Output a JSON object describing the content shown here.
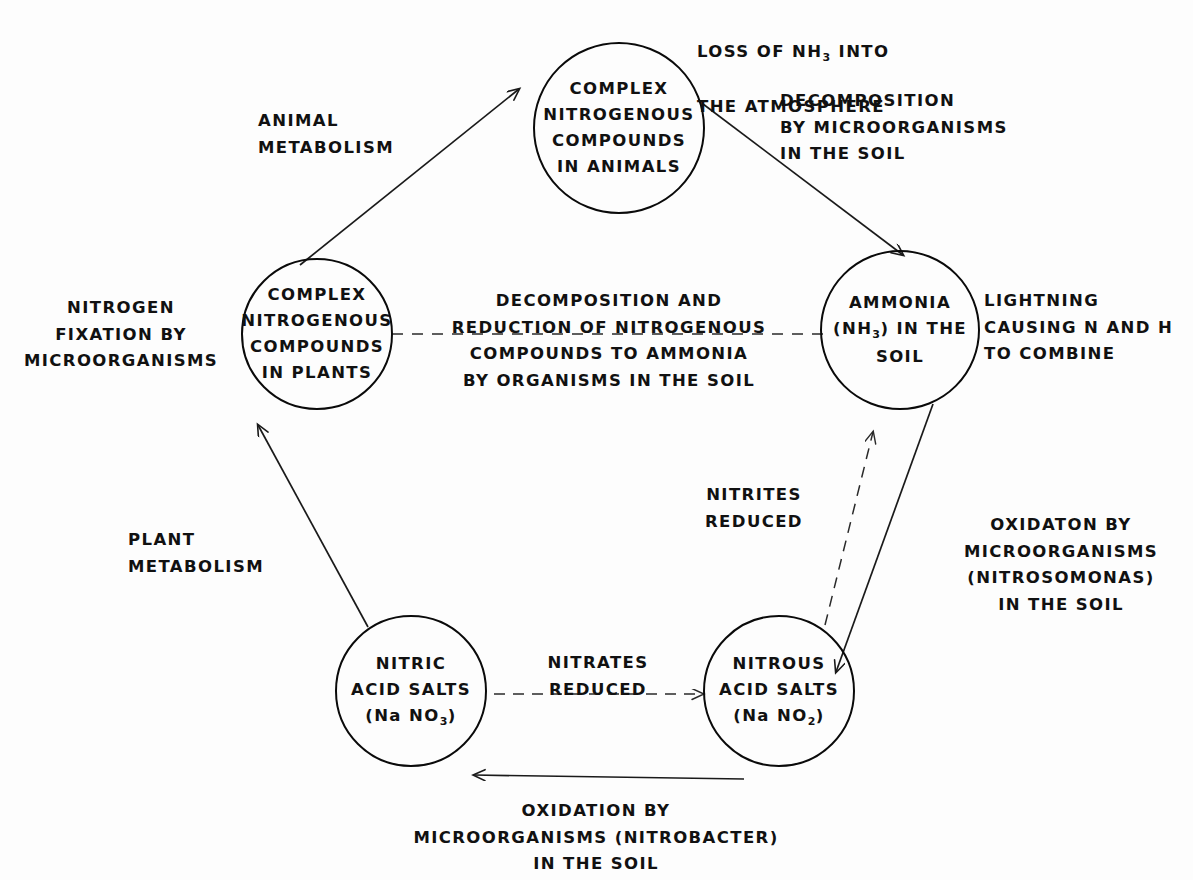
{
  "diagram": {
    "ink_color": "#111111",
    "background_color": "#fdfdfd"
  },
  "nodes": {
    "animals": {
      "id": "complex-nitrogenous-compounds-in-animals",
      "lines": [
        "COMPLEX",
        "NITROGENOUS",
        "COMPOUNDS",
        "IN ANIMALS"
      ]
    },
    "ammonia": {
      "id": "ammonia-in-the-soil",
      "lines": [
        "AMMONIA",
        "(NH3) IN THE",
        "SOIL"
      ],
      "line2_pre": "(NH",
      "line2_sub": "3",
      "line2_post": ") IN THE"
    },
    "plants": {
      "id": "complex-nitrogenous-compounds-in-plants",
      "lines": [
        "COMPLEX",
        "NITROGENOUS",
        "COMPOUNDS",
        "IN PLANTS"
      ]
    },
    "nitric": {
      "id": "nitric-acid-salts",
      "lines": [
        "NITRIC",
        "ACID SALTS",
        "(Na NO3)"
      ],
      "line3_pre": "(Na NO",
      "line3_sub": "3",
      "line3_post": ")"
    },
    "nitrous": {
      "id": "nitrous-acid-salts",
      "lines": [
        "NITROUS",
        "ACID SALTS",
        "(Na NO2)"
      ],
      "line3_pre": "(Na NO",
      "line3_sub": "2",
      "line3_post": ")"
    }
  },
  "labels": {
    "loss_of_nh3": {
      "pre": "LOSS OF  NH",
      "sub": "3",
      "post": "  INTO",
      "line2": "THE   ATMOSPHERE"
    },
    "animal_metabolism": "ANIMAL\nMETABOLISM",
    "decomposition_by_microorganisms": "DECOMPOSITION\nBY MICROORGANISMS\nIN THE SOIL",
    "nitrogen_fixation": "NITROGEN\nFIXATION BY\nMICROORGANISMS",
    "center_decomposition": "DECOMPOSITION  AND\nREDUCTION  OF  NITROGENOUS\nCOMPOUNDS  TO  AMMONIA\nBY ORGANISMS  IN THE  SOIL",
    "lightning": "LIGHTNING\nCAUSING N AND H\nTO  COMBINE",
    "plant_metabolism": "PLANT\nMETABOLISM",
    "nitrites_reduced": "NITRITES\nREDUCED",
    "oxidation_nitrosomonas": "OXIDATON BY\nMICROORGANISMS\n(NITROSOMONAS)\nIN THE SOIL",
    "nitrates_reduced": "NITRATES\nREDUCED",
    "oxidation_nitrobacter": "OXIDATION  BY\nMICROORGANISMS (NITROBACTER)\nIN THE SOIL"
  },
  "connections": [
    {
      "name": "plants-to-animals",
      "label": "ANIMAL METABOLISM",
      "style": "solid",
      "direction": "up-right"
    },
    {
      "name": "animals-to-ammonia",
      "label": "DECOMPOSITION BY MICROORGANISMS IN THE SOIL",
      "style": "solid",
      "direction": "down-right"
    },
    {
      "name": "plants-to-ammonia",
      "label": "DECOMPOSITION AND REDUCTION OF NITROGENOUS COMPOUNDS TO AMMONIA BY ORGANISMS IN THE SOIL",
      "style": "dashed",
      "direction": "horizontal"
    },
    {
      "name": "ammonia-to-nitrous",
      "label": "OXIDATON BY MICROORGANISMS (NITROSOMONAS) IN THE SOIL",
      "style": "solid",
      "direction": "down-left"
    },
    {
      "name": "nitrous-to-ammonia",
      "label": "NITRITES REDUCED",
      "style": "dashed",
      "direction": "up-right"
    },
    {
      "name": "nitrous-to-nitric",
      "label": "OXIDATION BY MICROORGANISMS (NITROBACTER) IN THE SOIL",
      "style": "solid",
      "direction": "left"
    },
    {
      "name": "nitric-to-nitrous",
      "label": "NITRATES REDUCED",
      "style": "dashed",
      "direction": "right"
    },
    {
      "name": "nitric-to-plants",
      "label": "PLANT METABOLISM",
      "style": "solid",
      "direction": "up"
    }
  ]
}
